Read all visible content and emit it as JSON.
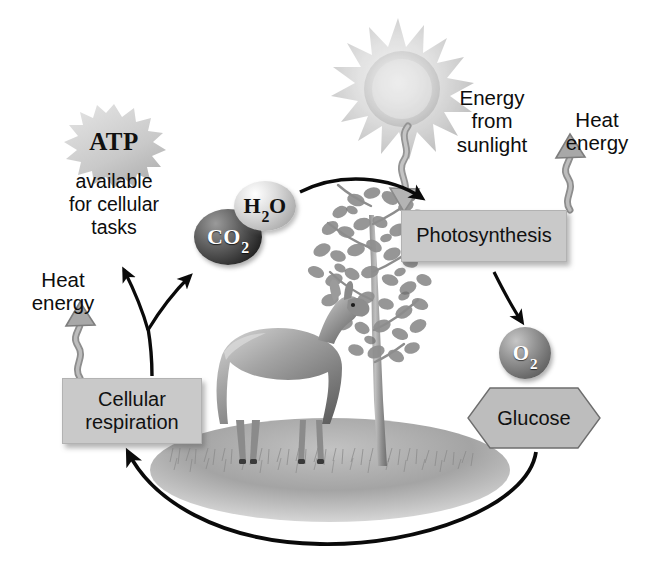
{
  "diagram": {
    "background_color": "#ffffff",
    "width": 646,
    "height": 573
  },
  "labels": {
    "energy_from_sunlight": "Energy\nfrom\nsunlight",
    "heat_energy_right": "Heat\nenergy",
    "heat_energy_left": "Heat\nenergy",
    "atp_caption": "available\nfor cellular\ntasks"
  },
  "boxes": {
    "photosynthesis": "Photosynthesis",
    "cellular_respiration": "Cellular\nrespiration"
  },
  "molecules": {
    "co2": {
      "formula": "CO",
      "subscript": "2",
      "color": "#1f1f1f",
      "text_color": "#ffffff"
    },
    "h2o": {
      "formula": "H",
      "subscript": "2",
      "suffix": "O",
      "color": "#c8c8c8",
      "text_color": "#111111"
    },
    "o2": {
      "formula": "O",
      "subscript": "2",
      "color": "#8a8a8a",
      "text_color": "#ffffff"
    }
  },
  "shapes": {
    "glucose": "Glucose",
    "atp": "ATP",
    "sun": "sun-icon",
    "ground": "grass-ground"
  },
  "illustrations": {
    "tree": "tree-illustration",
    "deer": "deer-illustration"
  },
  "colors": {
    "box_fill": "#c9c9c9",
    "box_stroke": "#b2b2b2",
    "arrow_black": "#0a0a0a",
    "arrow_gray": "#8f8f8f",
    "glucose_fill": "#bdbdbd",
    "atp_fill": "#cfcfcf",
    "sun_fill": "#d2d2d2",
    "ground_fill": "#9a9a9a"
  },
  "arrows": {
    "sunlight_to_photosynthesis": "wavy-gray-down-arrow",
    "photosynthesis_to_heat": "wavy-gray-up-arrow",
    "respiration_to_heat": "wavy-gray-up-arrow",
    "molecules_to_photosynthesis": "curved-black-arrow",
    "photosynthesis_to_o2": "straight-black-arrow",
    "glucose_to_respiration": "curved-black-arc-arrow",
    "respiration_to_atp": "curved-black-fork-arrow",
    "respiration_to_molecules": "curved-black-fork-arrow"
  }
}
